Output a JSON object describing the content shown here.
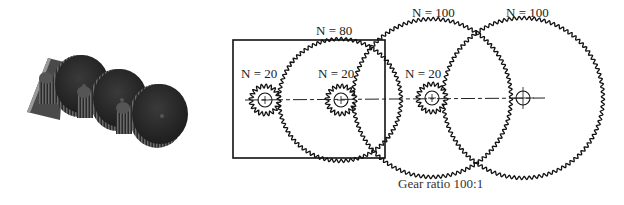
{
  "figure": {
    "photo": {
      "description": "3D render of compound gear train",
      "plate": {
        "color": "#4a4a4a",
        "edge_color": "#9a9a9a"
      },
      "disks": [
        {
          "cx": 82,
          "cy": 84,
          "r": 29
        },
        {
          "cx": 120,
          "cy": 98,
          "r": 29
        },
        {
          "cx": 160,
          "cy": 114,
          "r": 30
        }
      ],
      "disk_color": "#2e2e2e"
    },
    "frame": {
      "x": 233,
      "y": 40,
      "width": 152,
      "height": 118
    },
    "axis_y": 100,
    "gears": [
      {
        "id": "pinion-1",
        "teeth": 20,
        "label": "N = 20",
        "cx": 265,
        "cy": 100,
        "r": 14,
        "label_x": 241,
        "label_y": 78
      },
      {
        "id": "gear-80",
        "teeth": 80,
        "label": "N = 80",
        "cx": 340,
        "cy": 100,
        "r": 61,
        "label_x": 316,
        "label_y": 35
      },
      {
        "id": "pinion-2",
        "teeth": 20,
        "label": "N = 20",
        "cx": 341,
        "cy": 100,
        "r": 14,
        "label_x": 318,
        "label_y": 78
      },
      {
        "id": "gear-100-a",
        "teeth": 100,
        "label": "N = 100",
        "cx": 432,
        "cy": 98,
        "r": 79,
        "label_x": 412,
        "label_y": 17
      },
      {
        "id": "pinion-3",
        "teeth": 20,
        "label": "N = 20",
        "cx": 432,
        "cy": 98,
        "r": 14,
        "label_x": 405,
        "label_y": 78
      },
      {
        "id": "gear-100-b",
        "teeth": 100,
        "label": "N = 100",
        "cx": 523,
        "cy": 98,
        "r": 80,
        "label_x": 506,
        "label_y": 17
      }
    ],
    "caption": {
      "text": "Gear ratio  100:1",
      "x": 398,
      "y": 188
    }
  }
}
